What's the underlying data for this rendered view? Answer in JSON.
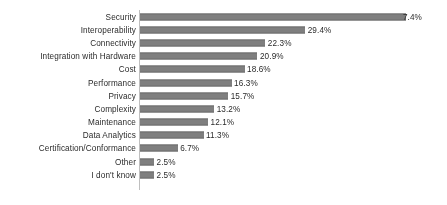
{
  "chart_data": {
    "type": "bar",
    "orientation": "horizontal",
    "title": "",
    "xlabel": "",
    "ylabel": "",
    "grid": false,
    "legend": "none",
    "axis_color": "#bfbfbf",
    "bar_color": "#7f7f7f",
    "value_suffix": "%",
    "xlim": [
      0,
      50
    ],
    "categories": [
      "Security",
      "Interoperability",
      "Connectivity",
      "Integration with Hardware",
      "Cost",
      "Performance",
      "Privacy",
      "Complexity",
      "Maintenance",
      "Data Analytics",
      "Certification/Conformance",
      "Other",
      "I don't know"
    ],
    "values": [
      47.4,
      29.4,
      22.3,
      20.9,
      18.6,
      16.3,
      15.7,
      13.2,
      12.1,
      11.3,
      6.7,
      2.5,
      2.5
    ],
    "value_labels": [
      "7.4%",
      "29.4%",
      "22.3%",
      "20.9%",
      "18.6%",
      "16.3%",
      "15.7%",
      "13.2%",
      "12.1%",
      "11.3%",
      "6.7%",
      "2.5%",
      "2.5%"
    ],
    "rows": [
      {
        "category": "Security",
        "value": 47.4,
        "label": "7.4%",
        "clipped": true
      },
      {
        "category": "Interoperability",
        "value": 29.4,
        "label": "29.4%",
        "clipped": false
      },
      {
        "category": "Connectivity",
        "value": 22.3,
        "label": "22.3%",
        "clipped": false
      },
      {
        "category": "Integration with Hardware",
        "value": 20.9,
        "label": "20.9%",
        "clipped": false
      },
      {
        "category": "Cost",
        "value": 18.6,
        "label": "18.6%",
        "clipped": false
      },
      {
        "category": "Performance",
        "value": 16.3,
        "label": "16.3%",
        "clipped": false
      },
      {
        "category": "Privacy",
        "value": 15.7,
        "label": "15.7%",
        "clipped": false
      },
      {
        "category": "Complexity",
        "value": 13.2,
        "label": "13.2%",
        "clipped": false
      },
      {
        "category": "Maintenance",
        "value": 12.1,
        "label": "12.1%",
        "clipped": false
      },
      {
        "category": "Data Analytics",
        "value": 11.3,
        "label": "11.3%",
        "clipped": false
      },
      {
        "category": "Certification/Conformance",
        "value": 6.7,
        "label": "6.7%",
        "clipped": false
      },
      {
        "category": "Other",
        "value": 2.5,
        "label": "2.5%",
        "clipped": false
      },
      {
        "category": "I don't know",
        "value": 2.5,
        "label": "2.5%",
        "clipped": false
      }
    ]
  }
}
